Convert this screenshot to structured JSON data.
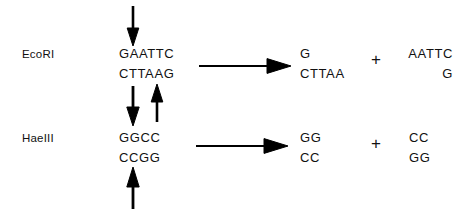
{
  "diagram": {
    "background_color": "#ffffff",
    "ink_color": "#000000",
    "rows": [
      {
        "enzyme": "EcoRI",
        "substrate": {
          "top_strand": "GAATTC",
          "bottom_strand": "CTTAAG"
        },
        "cut_arrows": {
          "top_down_label": "cut-site-top-strand",
          "bottom_up_label": "cut-site-bottom-strand"
        },
        "reaction_arrow": "reaction-arrow",
        "products": [
          {
            "top_strand": "G",
            "bottom_strand": "CTTAA",
            "align": "left"
          },
          {
            "top_strand": "AATTC",
            "bottom_strand": "G",
            "align": "right"
          }
        ],
        "plus": "+"
      },
      {
        "enzyme": "HaeIII",
        "substrate": {
          "top_strand": "GGCC",
          "bottom_strand": "CCGG"
        },
        "cut_arrows": {
          "top_down_label": "cut-site-top-strand",
          "bottom_up_label": "cut-site-bottom-strand"
        },
        "reaction_arrow": "reaction-arrow",
        "products": [
          {
            "top_strand": "GG",
            "bottom_strand": "CC",
            "align": "left"
          },
          {
            "top_strand": "CC",
            "bottom_strand": "GG",
            "align": "left"
          }
        ],
        "plus": "+"
      }
    ]
  }
}
